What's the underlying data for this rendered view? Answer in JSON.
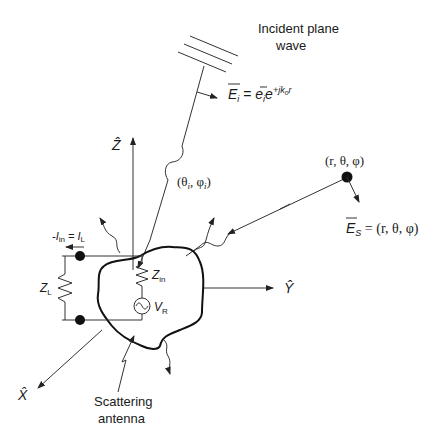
{
  "diagram": {
    "labels": {
      "incident_line1": "Incident plane",
      "incident_line2": "wave",
      "incident_field_E": "E",
      "incident_field_sub": "i",
      "incident_field_eq": " = ",
      "incident_field_e": "e",
      "incident_field_e_sub": "i",
      "incident_field_exp_base": "e",
      "incident_field_exp": "+jk",
      "incident_field_exp_sub": "o",
      "incident_field_exp_r": "r",
      "incident_angles": "(θ",
      "incident_angles_sub1": "i",
      "incident_angles_mid": ", φ",
      "incident_angles_sub2": "i",
      "incident_angles_end": ")",
      "observation_point": "(r, θ, φ)",
      "scattered_field_E": "E",
      "scattered_field_sub": "S",
      "scattered_field_eq": " = (r, θ, φ)",
      "axis_z": "Ẑ",
      "axis_y": "Ŷ",
      "axis_x": "X̂",
      "current_label_pre": "-I",
      "current_label_sub1": "in",
      "current_label_mid": " = I",
      "current_label_sub2": "L",
      "load_impedance": "Z",
      "load_impedance_sub": "L",
      "input_impedance": "Z",
      "input_impedance_sub": "in",
      "voltage_source": "V",
      "voltage_source_sub": "R",
      "antenna_line1": "Scattering",
      "antenna_line2": "antenna"
    },
    "colors": {
      "line": "#333333",
      "text": "#1a1a1a",
      "background": "#ffffff"
    }
  }
}
